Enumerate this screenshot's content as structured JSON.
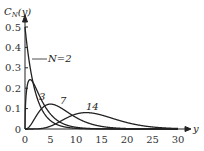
{
  "chart_data": {
    "type": "line",
    "title": "",
    "xlabel": "y",
    "ylabel": "C_N(y)",
    "xlim": [
      0,
      30
    ],
    "ylim": [
      0,
      0.5
    ],
    "xticks": [
      "0",
      "5",
      "10",
      "15",
      "20",
      "25",
      "30"
    ],
    "yticks": [
      "0",
      "0.1",
      "0.2",
      "0.3",
      "0.4",
      "0.5"
    ],
    "grid": false,
    "legend": "inline curve labels",
    "series": [
      {
        "name": "N=2",
        "label": "N=2",
        "peak_x": 0,
        "peak_y": 0.5
      },
      {
        "name": "N=3",
        "label": "3",
        "peak_x": 1,
        "peak_y": 0.24
      },
      {
        "name": "N=7",
        "label": "7",
        "peak_x": 5,
        "peak_y": 0.12
      },
      {
        "name": "N=14",
        "label": "14",
        "peak_x": 12,
        "peak_y": 0.076
      }
    ],
    "x": [
      0,
      1,
      2,
      3,
      4,
      5,
      6,
      7,
      8,
      10,
      12,
      14,
      16,
      18,
      20,
      22,
      25,
      28,
      30
    ]
  },
  "labels": {
    "ylabel_main": "C",
    "ylabel_sub": "N",
    "ylabel_rest": "(y)",
    "xlabel": "y",
    "n2": "N=2",
    "n3": "3",
    "n7": "7",
    "n14": "14"
  }
}
